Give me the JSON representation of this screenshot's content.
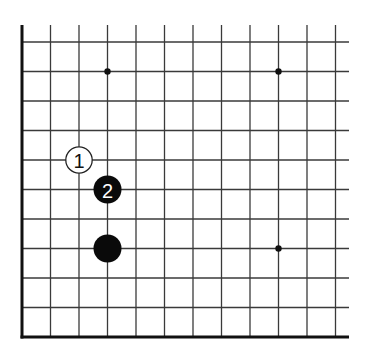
{
  "diagram": {
    "type": "go-board-fragment",
    "corner": "bottom-left",
    "grid": {
      "columns": 12,
      "rows": 11,
      "origin_x": 22,
      "first_row_y": 42,
      "col_spacing": 28.5,
      "row_spacing": 29.5,
      "line_top_y": 25,
      "line_right_x": 349,
      "bottom_edge_y": 337,
      "line_color": "#3a3a3a",
      "edge_color": "#111111"
    },
    "star_points": [
      {
        "col": 3,
        "row": 1
      },
      {
        "col": 9,
        "row": 1
      },
      {
        "col": 9,
        "row": 7
      }
    ],
    "stones": [
      {
        "color": "white",
        "col": 2,
        "row": 4,
        "label": "1"
      },
      {
        "color": "black",
        "col": 3,
        "row": 5,
        "label": "2"
      },
      {
        "color": "black",
        "col": 3,
        "row": 7,
        "label": ""
      }
    ]
  }
}
